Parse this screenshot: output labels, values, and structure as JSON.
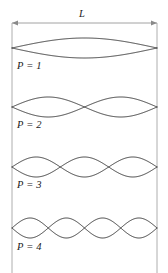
{
  "figure": {
    "kind": "standing-wave-modes-diagram",
    "background_color": "#ffffff",
    "width": 168,
    "height": 273
  },
  "dimension": {
    "label": "L",
    "label_x": 79,
    "label_y": 8,
    "line_y": 23,
    "x_start": 12,
    "x_end": 157,
    "color": "#8a8a8a",
    "arrowheads": "both"
  },
  "walls": {
    "color": "#9a9a9a",
    "left_x": 12,
    "right_x": 157,
    "y_top": 23,
    "y_bottom": 273
  },
  "wave": {
    "color": "#2b2b2b",
    "stroke_width": 0.9,
    "x_start": 12,
    "x_end": 157,
    "amplitude": 10
  },
  "modes": [
    {
      "label": "P = 1",
      "harmonic": 1,
      "axis_y": 48,
      "amplitude": 10,
      "label_x": 17,
      "label_y": 60
    },
    {
      "label": "P = 2",
      "harmonic": 2,
      "axis_y": 107,
      "amplitude": 10,
      "label_x": 17,
      "label_y": 119
    },
    {
      "label": "P = 3",
      "harmonic": 3,
      "axis_y": 167,
      "amplitude": 10,
      "label_x": 17,
      "label_y": 179
    },
    {
      "label": "P = 4",
      "harmonic": 4,
      "axis_y": 228,
      "amplitude": 10,
      "label_x": 17,
      "label_y": 241
    }
  ]
}
